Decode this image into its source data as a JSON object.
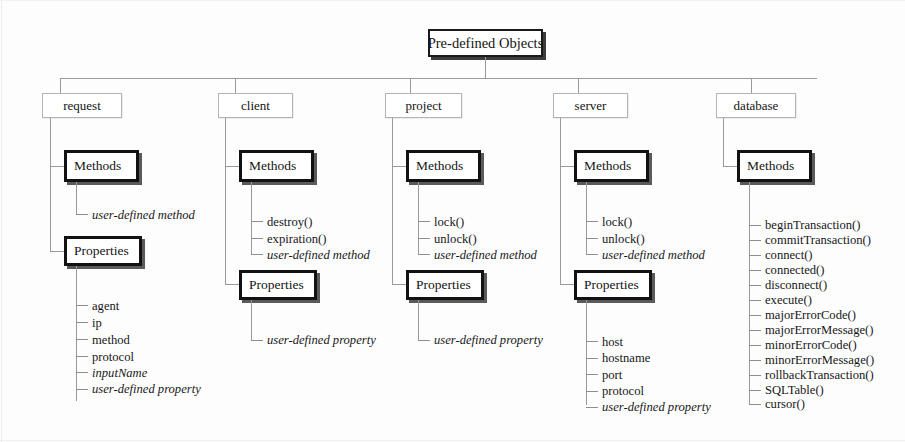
{
  "diagram": {
    "title": "Pre-defined Objects",
    "type": "object-hierarchy-tree",
    "root": {
      "label": "Pre-defined Objects"
    },
    "group_labels": {
      "methods": "Methods",
      "properties": "Properties"
    },
    "branches": [
      {
        "id": "request",
        "label": "request",
        "methods": {
          "label": "Methods",
          "items": [
            {
              "text": "user-defined method",
              "italic": true
            }
          ]
        },
        "properties": {
          "label": "Properties",
          "items": [
            {
              "text": "agent",
              "italic": false
            },
            {
              "text": "ip",
              "italic": false
            },
            {
              "text": "method",
              "italic": false
            },
            {
              "text": "protocol",
              "italic": false
            },
            {
              "text": "inputName",
              "italic": true
            },
            {
              "text": "user-defined property",
              "italic": true
            }
          ]
        }
      },
      {
        "id": "client",
        "label": "client",
        "methods": {
          "label": "Methods",
          "items": [
            {
              "text": "destroy()",
              "italic": false
            },
            {
              "text": "expiration()",
              "italic": false
            },
            {
              "text": "user-defined method",
              "italic": true
            }
          ]
        },
        "properties": {
          "label": "Properties",
          "items": [
            {
              "text": "user-defined property",
              "italic": true
            }
          ]
        }
      },
      {
        "id": "project",
        "label": "project",
        "methods": {
          "label": "Methods",
          "items": [
            {
              "text": "lock()",
              "italic": false
            },
            {
              "text": "unlock()",
              "italic": false
            },
            {
              "text": "user-defined method",
              "italic": true
            }
          ]
        },
        "properties": {
          "label": "Properties",
          "items": [
            {
              "text": "user-defined property",
              "italic": true
            }
          ]
        }
      },
      {
        "id": "server",
        "label": "server",
        "methods": {
          "label": "Methods",
          "items": [
            {
              "text": "lock()",
              "italic": false
            },
            {
              "text": "unlock()",
              "italic": false
            },
            {
              "text": "user-defined method",
              "italic": true
            }
          ]
        },
        "properties": {
          "label": "Properties",
          "items": [
            {
              "text": "host",
              "italic": false
            },
            {
              "text": "hostname",
              "italic": false
            },
            {
              "text": "port",
              "italic": false
            },
            {
              "text": "protocol",
              "italic": false
            },
            {
              "text": "user-defined property",
              "italic": true
            }
          ]
        }
      },
      {
        "id": "database",
        "label": "database",
        "methods": {
          "label": "Methods",
          "items": [
            {
              "text": "beginTransaction()",
              "italic": false
            },
            {
              "text": "commitTransaction()",
              "italic": false
            },
            {
              "text": "connect()",
              "italic": false
            },
            {
              "text": "connected()",
              "italic": false
            },
            {
              "text": "disconnect()",
              "italic": false
            },
            {
              "text": "execute()",
              "italic": false
            },
            {
              "text": "majorErrorCode()",
              "italic": false
            },
            {
              "text": "majorErrorMessage()",
              "italic": false
            },
            {
              "text": "minorErrorCode()",
              "italic": false
            },
            {
              "text": "minorErrorMessage()",
              "italic": false
            },
            {
              "text": "rollbackTransaction()",
              "italic": false
            },
            {
              "text": "SQLTable()",
              "italic": false
            },
            {
              "text": "cursor()",
              "italic": false
            }
          ]
        },
        "properties": null
      }
    ],
    "colors": {
      "background": "#fdfdfd",
      "line": "#9a9a9a",
      "box_border_strong": "#121212",
      "box_border_light": "#b4b4b4",
      "text": "#171717"
    }
  }
}
